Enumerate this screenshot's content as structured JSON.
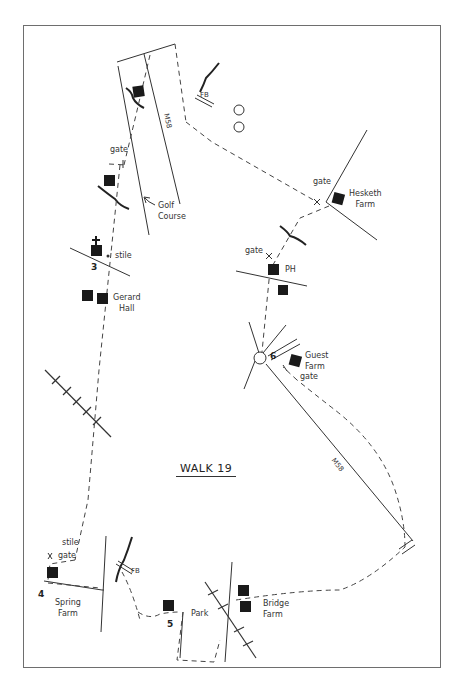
{
  "map": {
    "title": "WALK 19",
    "points": [
      {
        "id": "3",
        "label": "3"
      },
      {
        "id": "4",
        "label": "4"
      },
      {
        "id": "5",
        "label": "5"
      },
      {
        "id": "6",
        "label": "6"
      }
    ],
    "places": {
      "hesketh_farm": "Hesketh\nFarm",
      "golf_course": "Golf\nCourse",
      "gerard_hall": "Gerard\nHall",
      "ph": "PH",
      "guest_farm": "Guest\nFarm",
      "spring_farm": "Spring\nFarm",
      "park": "Park",
      "bridge_farm": "Bridge\nFarm"
    },
    "features": {
      "fb_north": "FB",
      "fb_south": "FB",
      "gate_nw": "gate",
      "gate_hesketh": "gate",
      "gate_ph": "gate",
      "gate_guest": "gate",
      "gate_spring": "gate",
      "stile_3": "stile",
      "stile_4": "stile"
    },
    "roads": {
      "m58_north": "M58",
      "m58_east": "M58"
    },
    "colors": {
      "ink": "#222222",
      "frame": "#6e6e6e",
      "path": "#444444"
    }
  }
}
